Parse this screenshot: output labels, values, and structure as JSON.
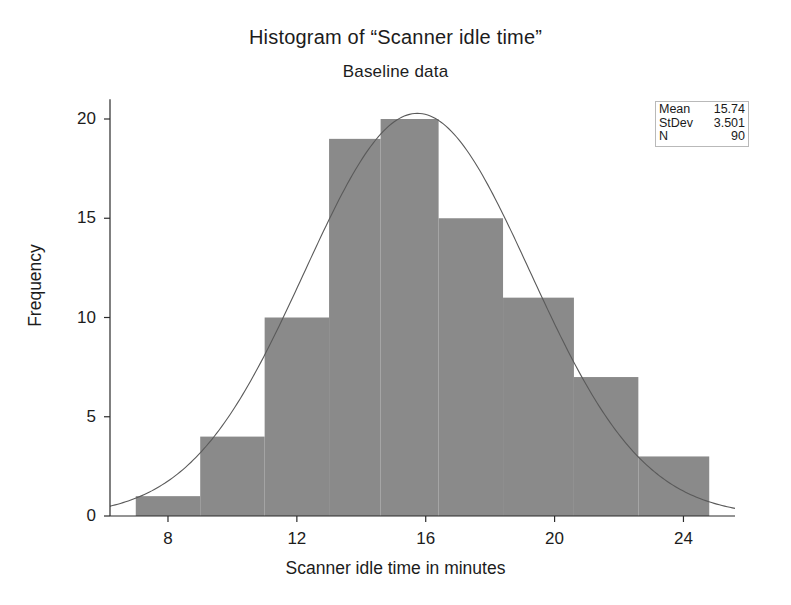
{
  "chart_data": {
    "type": "bar",
    "title": "Histogram of “Scanner idle time”",
    "subtitle": "Baseline data",
    "xlabel": "Scanner idle time in minutes",
    "ylabel": "Frequency",
    "xlim": [
      6.2,
      25.6
    ],
    "ylim": [
      0,
      21.5
    ],
    "grid": false,
    "legend_position": "top-right",
    "bin_edges": [
      7.0,
      9.0,
      11.0,
      13.0,
      14.6,
      16.4,
      18.4,
      20.6,
      22.6,
      24.8
    ],
    "categories": [
      "7.0-9.0",
      "9.0-11.0",
      "11.0-13.0",
      "13.0-14.6",
      "14.6-16.4",
      "16.4-18.4",
      "18.4-20.6",
      "20.6-22.6",
      "22.6-24.8"
    ],
    "values": [
      1,
      4,
      10,
      19,
      20,
      15,
      11,
      7,
      3
    ],
    "xticks": [
      8,
      12,
      16,
      20,
      24
    ],
    "yticks": [
      0,
      5,
      10,
      15,
      20
    ],
    "bar_color": "#8a8a8a",
    "curve_color": "#5a5a5a",
    "overlay_curve": {
      "name": "Normal fit",
      "mean": 15.74,
      "stdev": 3.501,
      "n": 90
    }
  },
  "stats": {
    "rows": [
      {
        "label": "Mean",
        "value": "15.74"
      },
      {
        "label": "StDev",
        "value": "3.501"
      },
      {
        "label": "N",
        "value": "90"
      }
    ]
  },
  "axis": {
    "x_tick_labels": [
      "8",
      "12",
      "16",
      "20",
      "24"
    ],
    "y_tick_labels": [
      "0",
      "5",
      "10",
      "15",
      "20"
    ]
  }
}
